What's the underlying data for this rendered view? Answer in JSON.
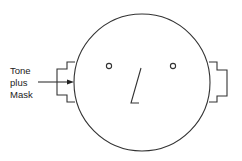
{
  "figure": {
    "type": "schematic head diagram",
    "label": {
      "lines": [
        "Tone",
        "plus",
        "Mask"
      ]
    },
    "colors": {
      "stroke": "#333333",
      "background": "#ffffff"
    },
    "elements": [
      "head-circle",
      "left-eye",
      "right-eye",
      "nose",
      "left-ear-headphone",
      "right-ear-headphone",
      "arrow-to-left-ear"
    ]
  }
}
